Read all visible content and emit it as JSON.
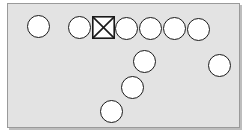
{
  "diagram": {
    "canvas": {
      "width": 250,
      "height": 136,
      "background": "#ffffff"
    },
    "panel": {
      "name": "board-panel",
      "x": 7,
      "y": 3,
      "width": 233,
      "height": 125,
      "fill": "#e3e3e3",
      "border_color": "#9a9a9a",
      "border_width": 1,
      "shadow_color": "#bdbdbd"
    },
    "style": {
      "node_fill": "#ffffff",
      "node_stroke": "#1a1a1a",
      "node_stroke_width": 1.6
    },
    "nodes": [
      {
        "id": "n1",
        "shape": "circle",
        "cx": 37,
        "cy": 25,
        "r": 11.5,
        "label": ""
      },
      {
        "id": "n2",
        "shape": "circle",
        "cx": 78,
        "cy": 26,
        "r": 11.5,
        "label": ""
      },
      {
        "id": "n3",
        "shape": "square-x",
        "cx": 102,
        "cy": 26,
        "r": 11.5,
        "label": ""
      },
      {
        "id": "n4",
        "shape": "circle",
        "cx": 125,
        "cy": 27,
        "r": 11.5,
        "label": ""
      },
      {
        "id": "n5",
        "shape": "circle",
        "cx": 149,
        "cy": 27,
        "r": 11.5,
        "label": ""
      },
      {
        "id": "n6",
        "shape": "circle",
        "cx": 173,
        "cy": 27,
        "r": 11.5,
        "label": ""
      },
      {
        "id": "n7",
        "shape": "circle",
        "cx": 197,
        "cy": 28,
        "r": 11.5,
        "label": ""
      },
      {
        "id": "n8",
        "shape": "circle",
        "cx": 143,
        "cy": 60,
        "r": 11.5,
        "label": ""
      },
      {
        "id": "n9",
        "shape": "circle",
        "cx": 218,
        "cy": 64,
        "r": 11.5,
        "label": ""
      },
      {
        "id": "n10",
        "shape": "circle",
        "cx": 131,
        "cy": 86,
        "r": 11.5,
        "label": ""
      },
      {
        "id": "n11",
        "shape": "circle",
        "cx": 110,
        "cy": 110,
        "r": 11.5,
        "label": ""
      }
    ]
  }
}
